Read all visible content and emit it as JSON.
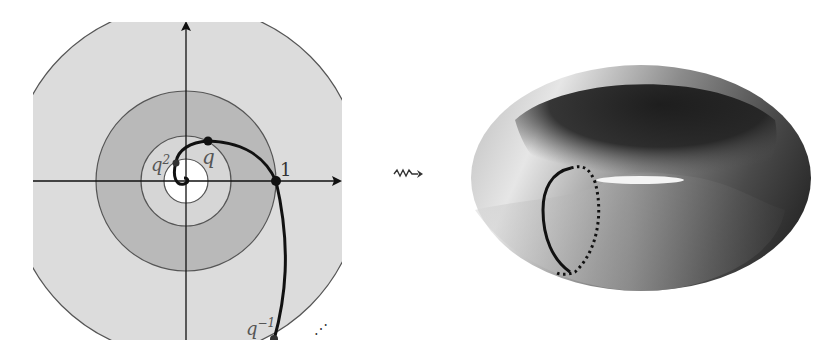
{
  "left_diagram": {
    "description": "Punctured complex plane with concentric annuli and logarithmic spiral through powers of q",
    "labels": {
      "q": "q",
      "q2_base": "q",
      "q2_exp": "2",
      "one": "1",
      "qinv_base": "q",
      "qinv_exp": "−1",
      "dots": "⋰"
    },
    "colors": {
      "outer_fill": "#dcdcdc",
      "annulus_dark": "#b9b9b9",
      "annulus_light": "#d6d6d6",
      "inner_disk": "#ffffff",
      "curve": "#111111",
      "circle_stroke": "#555555"
    }
  },
  "arrow": {
    "symbol": "⇝"
  },
  "right_diagram": {
    "description": "Torus obtained as quotient, with a meridian loop (solid front, dotted back)",
    "colors": {
      "torus_light": "#e8e8e8",
      "torus_dark": "#1a1a1a",
      "loop": "#111111"
    }
  }
}
